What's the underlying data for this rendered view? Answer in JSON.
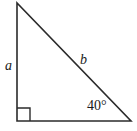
{
  "figure": {
    "kind": "right-triangle-diagram",
    "background_color": "#ffffff",
    "stroke_color": "#2b2b2b",
    "stroke_width": 1.6,
    "width": 137,
    "height": 131,
    "vertices": {
      "apex": {
        "x": 17,
        "y": 3
      },
      "right_angle": {
        "x": 17,
        "y": 121
      },
      "base_right": {
        "x": 131,
        "y": 121
      }
    },
    "right_angle_marker": {
      "x": 17,
      "y": 108,
      "size": 13,
      "label": "right-angle-marker"
    },
    "labels": {
      "leg_vertical": "a",
      "hypotenuse": "b",
      "angle": "40°"
    },
    "icons": {
      "right_angle": "right-angle-icon"
    }
  }
}
